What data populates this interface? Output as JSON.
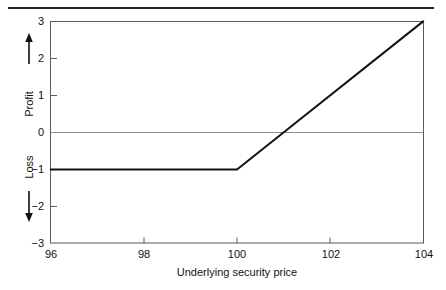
{
  "figure": {
    "has_top_rule": true,
    "background_color": "#ffffff"
  },
  "axes": {
    "x": {
      "title": "Underlying security price",
      "tick_labels": [
        "96",
        "98",
        "100",
        "102",
        "104"
      ],
      "tick_values": [
        96,
        98,
        100,
        102,
        104
      ],
      "min": 96,
      "max": 104
    },
    "y": {
      "title_positive": "Profit",
      "title_negative": "Loss",
      "arrow_up": "↑",
      "arrow_down": "↓",
      "tick_labels": [
        "3",
        "2",
        "1",
        "0",
        "−1",
        "−2",
        "−3"
      ],
      "tick_values": [
        3,
        2,
        1,
        0,
        -1,
        -2,
        -3
      ],
      "min": -3,
      "max": 3
    }
  },
  "colors": {
    "data_line": "#121212",
    "zero_line": "#8e8e8e",
    "frame": "#5b5b5b",
    "text": "#111111",
    "rule": "#232323"
  },
  "chart_data": {
    "type": "line",
    "title": "",
    "subtitle": "",
    "xlabel": "Underlying security price",
    "ylabel": "Profit / Loss",
    "xlim": [
      96,
      104
    ],
    "ylim": [
      -3,
      3
    ],
    "grid": false,
    "legend": "none",
    "xticks": [
      96,
      98,
      100,
      102,
      104
    ],
    "yticks": [
      -3,
      -2,
      -1,
      0,
      1,
      2,
      3
    ],
    "annotations": [
      {
        "text": "Profit",
        "axis": "y",
        "direction": "up"
      },
      {
        "text": "Loss",
        "axis": "y",
        "direction": "down"
      }
    ],
    "reference_lines": [
      {
        "orientation": "horizontal",
        "value": 0,
        "color": "#8e8e8e"
      }
    ],
    "series": [
      {
        "name": "Payoff",
        "color": "#121212",
        "x": [
          96,
          100,
          101,
          104
        ],
        "values": [
          -1,
          -1,
          0,
          3
        ],
        "breakeven": 101,
        "max_loss": -1,
        "strike": 100
      }
    ]
  }
}
